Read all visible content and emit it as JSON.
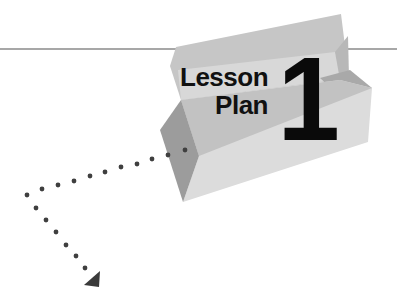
{
  "graphic": {
    "title_line1": "Lesson",
    "title_line2": "Plan",
    "number": "1"
  },
  "colors": {
    "rule_line": "#8a8a8a",
    "back_flap": "#c4c4c4",
    "inner_band": "#d6d6d6",
    "front_panel": "#dedede",
    "front_panel_shadow": "#bdbdbd",
    "left_facet": "#9e9e9e",
    "dots": "#3f3f3f",
    "arrowhead": "#3a3a3a",
    "text": "#111111"
  },
  "dotted_path": {
    "horizontal_dots": [
      [
        185,
        150
      ],
      [
        168,
        155
      ],
      [
        152,
        159
      ],
      [
        137,
        164
      ],
      [
        121,
        167
      ],
      [
        105,
        172
      ],
      [
        90,
        176
      ],
      [
        74,
        181
      ],
      [
        58,
        185
      ],
      [
        42,
        189
      ],
      [
        27,
        195
      ]
    ],
    "vertical_dots": [
      [
        36,
        208
      ],
      [
        46,
        220
      ],
      [
        56,
        232
      ],
      [
        66,
        245
      ],
      [
        76,
        256
      ],
      [
        85,
        268
      ]
    ],
    "arrowhead": [
      [
        100,
        270
      ],
      [
        85,
        285
      ],
      [
        98,
        287
      ]
    ]
  }
}
